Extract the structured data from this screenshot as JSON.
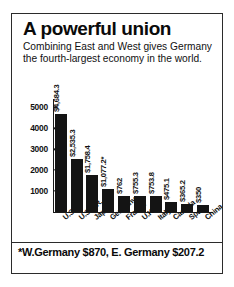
{
  "headline": "A powerful union",
  "deck": "Combining East and West gives Germany the fourth-largest economy in the world.",
  "footnote": "*W.Germany $870, E. Germany $207.2",
  "chart_data": {
    "type": "bar",
    "title": "A powerful union",
    "subtitle": "Combining East and West gives Germany the fourth-largest economy in the world.",
    "xlabel": "",
    "ylabel": "",
    "ylim": [
      0,
      5400
    ],
    "grid": false,
    "legend": "none",
    "yticks": [
      1000,
      2000,
      3000,
      4000,
      5000
    ],
    "ytick_labels": [
      "1000",
      "2000",
      "3000",
      "4000",
      "5000"
    ],
    "categories": [
      "U.S.",
      "U.S.S.R.",
      "Japan",
      "Germany",
      "France",
      "U.K.",
      "Italy",
      "Canada",
      "Spain",
      "China"
    ],
    "values": [
      4684.3,
      2535.3,
      1758.4,
      1077.2,
      762,
      755.3,
      753.8,
      475.1,
      365.2,
      350
    ],
    "data_labels": [
      "$4,684.3",
      "$2,535.3",
      "$1,758.4",
      "$1,077.2*",
      "$762",
      "$755.3",
      "$753.8",
      "$475.1",
      "$365.2",
      "$350"
    ],
    "annotations": [
      "*W.Germany $870, E. Germany $207.2"
    ]
  },
  "colors": {
    "bar": "#141414",
    "axis": "#1a1a1a",
    "border": "#2b2b2b",
    "background": "#ffffff"
  }
}
